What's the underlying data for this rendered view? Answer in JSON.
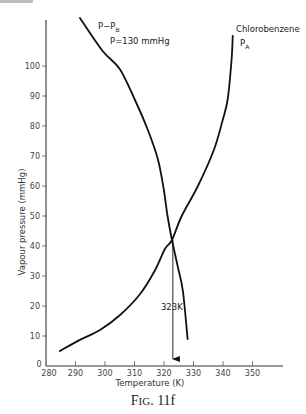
{
  "chart_data": {
    "type": "line",
    "title": "",
    "xlabel": "Temperature (K)",
    "ylabel": "Vapour pressure (mmHg)",
    "xlim": [
      280,
      360
    ],
    "ylim": [
      0,
      115
    ],
    "x_ticks": [
      280,
      290,
      300,
      310,
      320,
      330,
      340,
      350
    ],
    "y_ticks": [
      0,
      10,
      20,
      30,
      40,
      50,
      60,
      70,
      80,
      90,
      100
    ],
    "grid": false,
    "series": [
      {
        "name": "P - P_B (P = 130 mmHg)",
        "label_main": "P−P",
        "label_sub": "B",
        "label_line2": "P=130 mmHg",
        "points": [
          [
            291.5,
            116
          ],
          [
            299.2,
            105
          ],
          [
            305,
            99
          ],
          [
            310,
            89
          ],
          [
            314.4,
            79
          ],
          [
            317.9,
            69
          ],
          [
            319.9,
            59
          ],
          [
            321.2,
            50
          ],
          [
            322.7,
            42
          ],
          [
            324.7,
            33
          ],
          [
            326.4,
            25
          ],
          [
            328,
            9
          ]
        ]
      },
      {
        "name": "Chlorobenzene P_A",
        "label_main": "Chlorobenzene",
        "label_p": "P",
        "label_sub": "A",
        "points": [
          [
            284.7,
            5
          ],
          [
            291.5,
            8.7
          ],
          [
            298.3,
            12
          ],
          [
            305.1,
            17
          ],
          [
            311.9,
            24
          ],
          [
            317,
            32
          ],
          [
            320.3,
            39
          ],
          [
            322.7,
            42
          ],
          [
            326,
            50
          ],
          [
            331.5,
            60
          ],
          [
            336.9,
            72
          ],
          [
            339.9,
            82
          ],
          [
            341.6,
            89
          ],
          [
            342.9,
            102
          ],
          [
            343.3,
            110
          ]
        ]
      }
    ],
    "annotations": [
      {
        "text": "323K",
        "x": 323,
        "y_range": [
          0,
          42
        ],
        "type": "arrow-down"
      }
    ],
    "intersection": {
      "x": 323,
      "y": 42
    }
  },
  "figure": {
    "caption_prefix": "F",
    "caption_smallcaps": "IG",
    "caption_suffix": ". 11f"
  }
}
